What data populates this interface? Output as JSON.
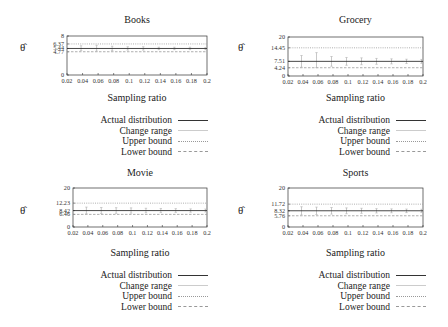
{
  "chart_data": [
    {
      "type": "line",
      "title": "Books",
      "xlabel": "Sampling ratio",
      "ylabel": "θ̂",
      "x": [
        0.02,
        0.04,
        0.06,
        0.08,
        0.1,
        0.12,
        0.14,
        0.16,
        0.18,
        0.2
      ],
      "x_tick_labels": [
        "0.02",
        "0.04",
        "0.06",
        "0.08",
        "0.1",
        "0.12",
        "0.14",
        "0.16",
        "0.18",
        "0.2"
      ],
      "ylim": [
        0,
        8
      ],
      "y_tick_labels": [
        "0",
        "4.77",
        "5.44",
        "6.37",
        "8"
      ],
      "series": [
        {
          "name": "Actual distribution",
          "style": "solid",
          "value": 5.44
        },
        {
          "name": "Change range",
          "style": "errorbar",
          "values": [
            [
              5.0,
              6.0
            ],
            [
              4.9,
              6.1
            ],
            [
              5.0,
              5.9
            ],
            [
              5.1,
              5.8
            ],
            [
              5.1,
              5.8
            ],
            [
              5.2,
              5.7
            ],
            [
              5.2,
              5.7
            ],
            [
              5.2,
              5.7
            ],
            [
              5.2,
              5.6
            ]
          ]
        },
        {
          "name": "Upper bound",
          "style": "dotted",
          "value": 6.37
        },
        {
          "name": "Lower bound",
          "style": "dashed",
          "value": 4.77
        }
      ],
      "legend_position": "below-right"
    },
    {
      "type": "line",
      "title": "Grocery",
      "xlabel": "Sampling ratio",
      "ylabel": "θ̂",
      "x": [
        0.02,
        0.04,
        0.06,
        0.08,
        0.1,
        0.12,
        0.14,
        0.16,
        0.18,
        0.2
      ],
      "x_tick_labels": [
        "0.02",
        "0.04",
        "0.06",
        "0.08",
        "0.1",
        "0.12",
        "0.14",
        "0.16",
        "0.18",
        "0.2"
      ],
      "ylim": [
        0,
        20
      ],
      "y_tick_labels": [
        "0",
        "4.24",
        "7.51",
        "14.45",
        "20"
      ],
      "series": [
        {
          "name": "Actual distribution",
          "style": "solid",
          "value": 7.51
        },
        {
          "name": "Change range",
          "style": "errorbar",
          "values": [
            [
              4.5,
              10.5
            ],
            [
              4.3,
              12.0
            ],
            [
              5.0,
              10.0
            ],
            [
              5.5,
              9.5
            ],
            [
              5.8,
              9.3
            ],
            [
              6.0,
              9.0
            ],
            [
              6.2,
              8.8
            ],
            [
              6.4,
              8.6
            ],
            [
              6.5,
              8.5
            ]
          ]
        },
        {
          "name": "Upper bound",
          "style": "dotted",
          "value": 14.45
        },
        {
          "name": "Lower bound",
          "style": "dashed",
          "value": 4.24
        }
      ],
      "legend_position": "below-right"
    },
    {
      "type": "line",
      "title": "Movie",
      "xlabel": "Sampling ratio",
      "ylabel": "θ̂",
      "x": [
        0.02,
        0.04,
        0.06,
        0.08,
        0.1,
        0.12,
        0.14,
        0.16,
        0.18,
        0.2
      ],
      "x_tick_labels": [
        "0.02",
        "0.04",
        "0.06",
        "0.08",
        "0.1",
        "0.12",
        "0.14",
        "0.16",
        "0.18",
        "0.2"
      ],
      "ylim": [
        0,
        20
      ],
      "y_tick_labels": [
        "0",
        "6.46",
        "8.42",
        "12.23",
        "20"
      ],
      "series": [
        {
          "name": "Actual distribution",
          "style": "solid",
          "value": 8.42
        },
        {
          "name": "Change range",
          "style": "errorbar",
          "values": [
            [
              6.8,
              10.2
            ],
            [
              6.9,
              10.0
            ],
            [
              7.0,
              9.9
            ],
            [
              7.1,
              9.8
            ],
            [
              7.3,
              9.6
            ],
            [
              7.4,
              9.5
            ],
            [
              7.5,
              9.4
            ],
            [
              7.6,
              9.3
            ],
            [
              7.7,
              9.2
            ]
          ]
        },
        {
          "name": "Upper bound",
          "style": "dotted",
          "value": 12.23
        },
        {
          "name": "Lower bound",
          "style": "dashed",
          "value": 6.46
        }
      ],
      "legend_position": "below-right"
    },
    {
      "type": "line",
      "title": "Sports",
      "xlabel": "Sampling ratio",
      "ylabel": "θ̂",
      "x": [
        0.02,
        0.04,
        0.06,
        0.08,
        0.1,
        0.12,
        0.14,
        0.16,
        0.18,
        0.2
      ],
      "x_tick_labels": [
        "0.02",
        "0.04",
        "0.06",
        "0.08",
        "0.1",
        "0.12",
        "0.14",
        "0.16",
        "0.18",
        "0.2"
      ],
      "ylim": [
        0,
        20
      ],
      "y_tick_labels": [
        "0",
        "5.76",
        "8.32",
        "11.72",
        "20"
      ],
      "series": [
        {
          "name": "Actual distribution",
          "style": "solid",
          "value": 8.32
        },
        {
          "name": "Change range",
          "style": "errorbar",
          "values": [
            [
              6.2,
              10.4
            ],
            [
              6.4,
              10.2
            ],
            [
              6.6,
              10.0
            ],
            [
              6.8,
              9.8
            ],
            [
              7.0,
              9.6
            ],
            [
              7.2,
              9.4
            ],
            [
              7.3,
              9.3
            ],
            [
              7.4,
              9.2
            ],
            [
              7.5,
              9.1
            ]
          ]
        },
        {
          "name": "Upper bound",
          "style": "dotted",
          "value": 11.72
        },
        {
          "name": "Lower bound",
          "style": "dashed",
          "value": 5.76
        }
      ],
      "legend_position": "below-right"
    }
  ],
  "panels": [
    {
      "title": "Books",
      "xlabel": "Sampling ratio",
      "ylabel": "θ̂"
    },
    {
      "title": "Grocery",
      "xlabel": "Sampling ratio",
      "ylabel": "θ̂"
    },
    {
      "title": "Movie",
      "xlabel": "Sampling ratio",
      "ylabel": "θ̂"
    },
    {
      "title": "Sports",
      "xlabel": "Sampling ratio",
      "ylabel": "θ̂"
    }
  ],
  "legend": {
    "items": [
      "Actual distribution",
      "Change range",
      "Upper bound",
      "Lower bound"
    ]
  },
  "colors": {
    "axis": "#333333",
    "actual": "#333333",
    "change_range": "#b0b0b0",
    "upper": "#9a9a9a",
    "lower": "#9a9a9a"
  }
}
